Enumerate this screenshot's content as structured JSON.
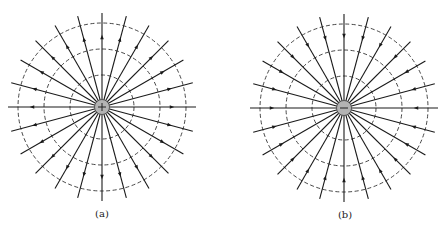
{
  "diagram": {
    "colors": {
      "line": "#1a1a1a",
      "dash": "#333333",
      "charge_fill": "#b3b3b3",
      "charge_stroke": "#444444",
      "background": "#ffffff"
    },
    "panels": [
      {
        "id": "a",
        "label": "(a)",
        "charge_sign": "+",
        "charge_type": "positive",
        "arrow_direction": "outward",
        "center": [
          102,
          107
        ],
        "charge_radius": 7.5,
        "line_count": 24,
        "line_length": 94,
        "arrow_radius": 70,
        "equipotential_radii": [
          32,
          58,
          84
        ],
        "label_pos": [
          102,
          208
        ]
      },
      {
        "id": "b",
        "label": "(b)",
        "charge_sign": "−",
        "charge_type": "negative",
        "arrow_direction": "inward",
        "center": [
          344,
          108
        ],
        "charge_radius": 7.5,
        "line_count": 24,
        "line_length": 94,
        "arrow_radius": 72,
        "equipotential_radii": [
          32,
          58,
          84
        ],
        "label_pos": [
          345,
          209
        ]
      }
    ]
  }
}
